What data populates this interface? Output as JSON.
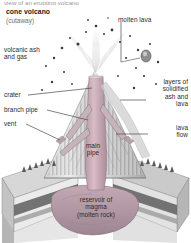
{
  "diagram": {
    "clipped_caption": "view of an erupting volcano",
    "title": "cone volcano",
    "subtitle": "(cutaway)",
    "labels": {
      "volcanic_ash": "volcanic ash\nand gas",
      "crater": "crater",
      "branch_pipe": "branch pipe",
      "vent": "vent",
      "molten_lava": "molten lava",
      "layers": "layers of\nsolidified\nash and\nlava",
      "lava_flow": "lava\nflow",
      "main_pipe": "main\npipe",
      "reservoir": "reservoir of\nmagma\n(molten rock)"
    },
    "colors": {
      "background": "#ffffff",
      "text": "#2b2b2b",
      "subtitle_text": "#6e6e6e",
      "leader_line": "#4a4a4a",
      "ash_particle": "#3a3a3a",
      "main_pipe": "#c8a8b4",
      "magma": "#b8a0ab",
      "rock_light": "#e2e2e2",
      "rock_mid": "#b4b4b4",
      "rock_dark": "#6b6b6b",
      "stratum_dark": "#4d4d4d",
      "plume": "#d8d8d8",
      "tree": "#5a5a5a"
    }
  }
}
